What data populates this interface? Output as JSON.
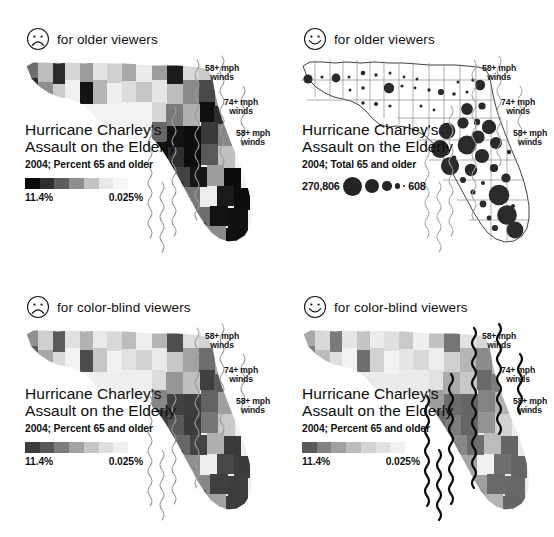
{
  "figure": {
    "title": "Hurricane Charley's Assault on the Elderly",
    "panel_count": 4
  },
  "panels": [
    {
      "id": "top-left",
      "face_icon": "frowning-face-icon",
      "face_type": "frown",
      "caption": "for older viewers",
      "title_line1": "Hurricane Charley's",
      "title_line2": "Assault on the Elderly",
      "subtitle": "2004; Percent 65 and older",
      "legend_type": "ramp",
      "legend_high": "11.4%",
      "legend_low": "0.025%",
      "ramp_colors": [
        "#0b0b0b",
        "#2e2e2e",
        "#5d5d5d",
        "#8f8f8f",
        "#c3c3c3",
        "#e9e9e9",
        "#f6f6f6"
      ],
      "map_style": "choropleth-dark",
      "wind_labels": [
        {
          "line1": "58+ mph",
          "line2": "winds"
        },
        {
          "line1": "74+ mph",
          "line2": "winds"
        },
        {
          "line1": "58+ mph",
          "line2": "winds"
        }
      ]
    },
    {
      "id": "top-right",
      "face_icon": "smiling-face-icon",
      "face_type": "smile",
      "caption": "for older viewers",
      "title_line1": "Hurricane Charley's",
      "title_line2": "Assault on the Elderly",
      "subtitle": "2004; Total 65 and older",
      "legend_type": "graduated-symbol",
      "legend_high": "270,806",
      "legend_low": "608",
      "legend_circle_radii": [
        9.5,
        7.2,
        4.8,
        2.6,
        1.2
      ],
      "map_style": "proportional-circles",
      "wind_labels": [
        {
          "line1": "58+ mph",
          "line2": "winds"
        },
        {
          "line1": "74+ mph",
          "line2": "winds"
        },
        {
          "line1": "58+ mph",
          "line2": "winds"
        }
      ]
    },
    {
      "id": "bottom-left",
      "face_icon": "frowning-face-icon",
      "face_type": "frown",
      "caption": "for color-blind viewers",
      "title_line1": "Hurricane Charley's",
      "title_line2": "Assault on the Elderly",
      "subtitle": "2004; Percent 65 and older",
      "legend_type": "ramp",
      "legend_high": "11.4%",
      "legend_low": "0.025%",
      "ramp_colors": [
        "#3c3c3c",
        "#585858",
        "#7c7c7c",
        "#a3a3a3",
        "#c6c6c6",
        "#dedede",
        "#efefef"
      ],
      "map_style": "choropleth-mid",
      "wind_labels": [
        {
          "line1": "58+ mph",
          "line2": "winds"
        },
        {
          "line1": "74+ mph",
          "line2": "winds"
        },
        {
          "line1": "58+ mph",
          "line2": "winds"
        }
      ]
    },
    {
      "id": "bottom-right",
      "face_icon": "smiling-face-icon",
      "face_type": "smile",
      "caption": "for color-blind viewers",
      "title_line1": "Hurricane Charley's",
      "title_line2": "Assault on the Elderly",
      "subtitle": "2004; Percent 65 and older",
      "legend_type": "ramp",
      "legend_high": "11.4%",
      "legend_low": "0.025%",
      "ramp_colors": [
        "#5a5a5a",
        "#828282",
        "#a0a0a0",
        "#bcbcbc",
        "#d2d2d2",
        "#e2e2e2",
        "#f0f0f0"
      ],
      "map_style": "choropleth-light-bold-winds",
      "wind_labels": [
        {
          "line1": "58+ mph",
          "line2": "winds"
        },
        {
          "line1": "74+ mph",
          "line2": "winds"
        },
        {
          "line1": "58+ mph",
          "line2": "winds"
        }
      ]
    }
  ],
  "chart_data": {
    "type": "map",
    "variable_percent": "Percent 65 and older, 2004",
    "variable_total": "Total 65 and older, 2004",
    "percent_range": [
      "0.025%",
      "11.4%"
    ],
    "total_range": [
      "608",
      "270,806"
    ],
    "hazard_bands": [
      "58+ mph winds",
      "74+ mph winds",
      "58+ mph winds"
    ],
    "encodings": [
      "choropleth",
      "graduated-symbol"
    ],
    "legend_position": "left-center of each panel"
  }
}
